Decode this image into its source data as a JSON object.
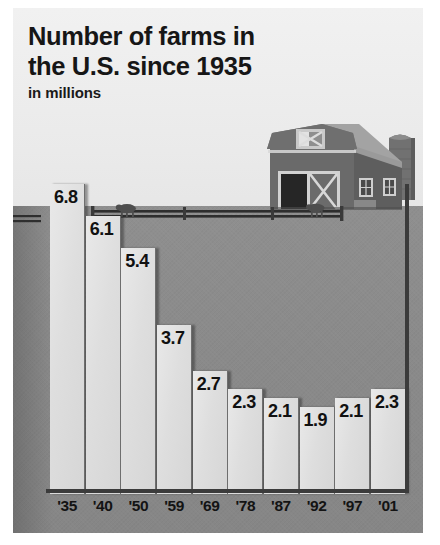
{
  "title_line1": "Number of farms in",
  "title_line2": "the U.S. since 1935",
  "subtitle": "in millions",
  "illustration": {
    "barn_label": "red-barn-with-silo",
    "fence_label": "livestock-fence"
  },
  "chart_data": {
    "type": "bar",
    "title": "Number of farms in the U.S. since 1935",
    "subtitle": "in millions",
    "xlabel": "",
    "ylabel": "in millions",
    "ylim": [
      0,
      6.8
    ],
    "grid": false,
    "legend": "none",
    "categories": [
      "'35",
      "'40",
      "'50",
      "'59",
      "'69",
      "'78",
      "'87",
      "'92",
      "'97",
      "'01"
    ],
    "values": [
      6.8,
      6.1,
      5.4,
      3.7,
      2.7,
      2.3,
      2.1,
      1.9,
      2.1,
      2.3
    ],
    "value_labels": [
      "6.8",
      "6.1",
      "5.4",
      "3.7",
      "2.7",
      "2.3",
      "2.1",
      "1.9",
      "2.1",
      "2.3"
    ],
    "units": "millions of farms"
  },
  "colors": {
    "sky": "#efefef",
    "ground": "#8a8a8a",
    "bar": "#dedede",
    "bar_edge": "#6e6e6e",
    "axis": "#3b3b3b",
    "text": "#141414",
    "barn": "#6d6d6d",
    "barn_roof": "#9a9a9a"
  }
}
